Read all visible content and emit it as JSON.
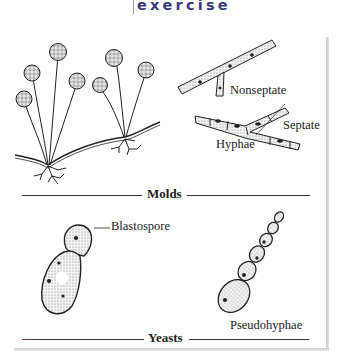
{
  "header": {
    "title": "exercise",
    "title_color": "#3b3b7c"
  },
  "figure": {
    "sections": [
      {
        "title": "Molds",
        "labels": {
          "nonseptate": "Nonseptate",
          "septate": "Septate",
          "hyphae": "Hyphae"
        }
      },
      {
        "title": "Yeasts",
        "labels": {
          "blastospore": "Blastospore",
          "pseudohyphae": "Pseudohyphae"
        }
      }
    ]
  },
  "icons": {
    "mold": "mold-sporangia-illustration",
    "nonseptate": "nonseptate-hypha-illustration",
    "septate": "septate-hypha-illustration",
    "yeast": "budding-yeast-illustration",
    "pseudohyphae": "pseudohyphae-chain-illustration"
  }
}
